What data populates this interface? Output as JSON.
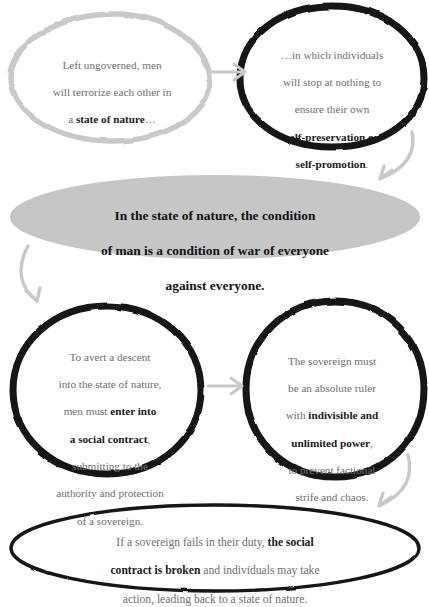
{
  "diagram": {
    "colors": {
      "light_outline": "#c9c9c9",
      "dark_outline": "#141414",
      "fill_gray": "#c6c6c6",
      "body_text": "#6e6e6e",
      "emphasis_text": "#1a1a1a",
      "arrow": "#c9c9c9",
      "background": "#ffffff"
    },
    "nodes": [
      {
        "id": "node-1",
        "shape": "rounded-circle-outline",
        "outline": "light-gray",
        "lines": [
          {
            "text": "Left ungoverned, men"
          },
          {
            "text": "will terrorize each other in"
          },
          {
            "text": "a "
          },
          {
            "text": "state of nature",
            "bold": true
          },
          {
            "text": "…"
          }
        ],
        "plain_text": "Left ungoverned, men will terrorize each other in a state of nature…"
      },
      {
        "id": "node-2",
        "shape": "circle-outline",
        "outline": "black-thick",
        "lines": [
          {
            "text": "…in which individuals"
          },
          {
            "text": "will stop at nothing to"
          },
          {
            "text": "ensure their own"
          },
          {
            "text": "self-preservation or",
            "bold": true
          },
          {
            "text": "self-promotion",
            "bold": true
          },
          {
            "text": "."
          }
        ],
        "plain_text": "…in which individuals will stop at nothing to ensure their own self-preservation or self-promotion."
      },
      {
        "id": "node-3",
        "shape": "ellipse-filled",
        "outline": "none",
        "fill": "gray",
        "lines": [
          {
            "text": "In the state of nature, the condition",
            "bold": true
          },
          {
            "text": "of man is a condition of war of everyone",
            "bold": true
          },
          {
            "text": "against everyone.",
            "bold": true
          }
        ],
        "plain_text": "In the state of nature, the condition of man is a condition of war of everyone against everyone."
      },
      {
        "id": "node-4",
        "shape": "circle-outline",
        "outline": "black-thick",
        "lines": [
          {
            "text": "To avert a descent"
          },
          {
            "text": "into the state of nature,"
          },
          {
            "text": "men must "
          },
          {
            "text": "enter into",
            "bold": true
          },
          {
            "text": "a social contract",
            "bold": true
          },
          {
            "text": ", submitting to the"
          },
          {
            "text": "authority and protection"
          },
          {
            "text": "of a sovereign."
          }
        ],
        "plain_text": "To avert a descent into the state of nature, men must enter into a social contract, submitting to the authority and protection of a sovereign."
      },
      {
        "id": "node-5",
        "shape": "circle-outline",
        "outline": "black-thick",
        "lines": [
          {
            "text": "The sovereign must"
          },
          {
            "text": "be an absolute ruler"
          },
          {
            "text": "with "
          },
          {
            "text": "indivisible and",
            "bold": true
          },
          {
            "text": "unlimited power",
            "bold": true
          },
          {
            "text": ", to prevent factional"
          },
          {
            "text": "strife and chaos."
          }
        ],
        "plain_text": "The sovereign must be an absolute ruler with indivisible and unlimited power, to prevent factional strife and chaos."
      },
      {
        "id": "node-6",
        "shape": "ellipse-outline",
        "outline": "black-thin",
        "lines": [
          {
            "text": "If a sovereign fails in their duty, "
          },
          {
            "text": "the social",
            "bold": true
          },
          {
            "text": "contract is broken",
            "bold": true
          },
          {
            "text": " and individuals may take"
          },
          {
            "text": "action, leading back to a state of nature."
          }
        ],
        "plain_text": "If a sovereign fails in their duty, the social contract is broken and individuals may take action, leading back to a state of nature."
      }
    ],
    "arrows": [
      {
        "id": "arrow-1-to-2",
        "from": "node-1",
        "to": "node-2",
        "style": "straight-right"
      },
      {
        "id": "arrow-2-to-3",
        "from": "node-2",
        "to": "node-3",
        "style": "curved-down-left"
      },
      {
        "id": "arrow-3-to-4",
        "from": "node-3",
        "to": "node-4",
        "style": "curved-down"
      },
      {
        "id": "arrow-4-to-5",
        "from": "node-4",
        "to": "node-5",
        "style": "straight-right"
      },
      {
        "id": "arrow-5-to-6",
        "from": "node-5",
        "to": "node-6",
        "style": "curved-down-left"
      }
    ]
  },
  "text": {
    "node1": {
      "l1": "Left ungoverned, men",
      "l2": "will terrorize each other in",
      "l3a": "a ",
      "l3b": "state of nature",
      "l3c": "…"
    },
    "node2": {
      "l1": "…in which individuals",
      "l2": "will stop at nothing to",
      "l3": "ensure their own",
      "l4": "self-preservation or",
      "l5": "self-promotion",
      "l5b": "."
    },
    "node3": {
      "l1": "In the state of nature, the condition",
      "l2": "of man is a condition of war of everyone",
      "l3": "against everyone."
    },
    "node4": {
      "l1": "To avert a descent",
      "l2": "into the state of nature,",
      "l3a": "men must ",
      "l3b": "enter into",
      "l4b": "a social contract",
      "l4c": ",",
      "l5": "submitting to the",
      "l6": "authority and protection",
      "l7": "of a sovereign."
    },
    "node5": {
      "l1": "The sovereign must",
      "l2": "be an absolute ruler",
      "l3a": "with ",
      "l3b": "indivisible and",
      "l4b": "unlimited power",
      "l4c": ",",
      "l5": "to prevent factional",
      "l6": "strife and chaos."
    },
    "node6": {
      "l1a": "If a sovereign fails in their duty, ",
      "l1b": "the social",
      "l2b": "contract is broken",
      "l2c": " and individuals may take",
      "l3": "action, leading back to a state of nature."
    }
  }
}
